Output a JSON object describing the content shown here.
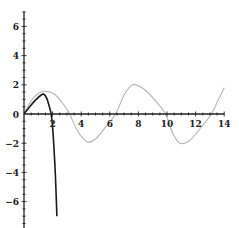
{
  "chart_data": {
    "type": "line",
    "title": "",
    "xlabel": "",
    "ylabel": "",
    "xlim": [
      0,
      14
    ],
    "ylim": [
      -7,
      7
    ],
    "grid": false,
    "legend": null,
    "x_ticks": [
      2,
      4,
      6,
      8,
      10,
      12,
      14
    ],
    "y_ticks": [
      -6,
      -4,
      -2,
      0,
      2,
      4,
      6
    ],
    "x_tick_labels": [
      "2",
      "4",
      "6",
      "8",
      "10",
      "12",
      "14"
    ],
    "y_tick_labels": [
      "-6",
      "-4",
      "-2",
      "0",
      "2",
      "4",
      "6"
    ],
    "series": [
      {
        "name": "gray-curve",
        "color": "#b5b5b5",
        "points": [
          [
            0,
            0
          ],
          [
            0.5,
            0.9
          ],
          [
            1.0,
            1.4
          ],
          [
            1.6,
            1.55
          ],
          [
            2.2,
            1.3
          ],
          [
            2.8,
            0.6
          ],
          [
            3.2,
            0.0
          ],
          [
            3.7,
            -1.1
          ],
          [
            4.4,
            -1.9
          ],
          [
            5.0,
            -1.7
          ],
          [
            5.7,
            -0.9
          ],
          [
            6.4,
            0.0
          ],
          [
            7.0,
            1.3
          ],
          [
            7.6,
            2.0
          ],
          [
            8.4,
            1.7
          ],
          [
            9.2,
            0.9
          ],
          [
            9.9,
            0.0
          ],
          [
            10.4,
            -1.3
          ],
          [
            10.9,
            -2.0
          ],
          [
            11.6,
            -1.8
          ],
          [
            12.4,
            -0.9
          ],
          [
            13.1,
            0.0
          ],
          [
            13.6,
            1.0
          ],
          [
            14.0,
            1.8
          ]
        ]
      },
      {
        "name": "dark-curve",
        "color": "#1a1a1a",
        "points": [
          [
            0,
            0
          ],
          [
            0.4,
            0.5
          ],
          [
            0.8,
            0.95
          ],
          [
            1.2,
            1.3
          ],
          [
            1.4,
            1.35
          ],
          [
            1.6,
            1.05
          ],
          [
            1.8,
            0.4
          ],
          [
            1.9,
            0.0
          ],
          [
            2.0,
            -0.9
          ],
          [
            2.1,
            -2.4
          ],
          [
            2.2,
            -4.3
          ],
          [
            2.3,
            -7.0
          ]
        ]
      }
    ]
  }
}
